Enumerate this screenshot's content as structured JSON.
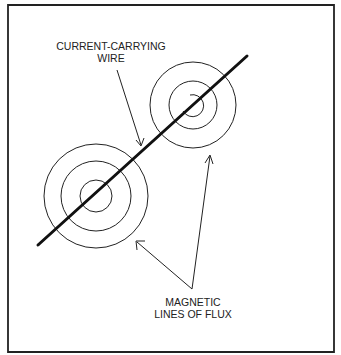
{
  "diagram": {
    "labels": {
      "wire_line1": "CURRENT-CARRYING",
      "wire_line2": "WIRE",
      "flux_line1": "MAGNETIC",
      "flux_line2": "LINES OF FLUX"
    },
    "colors": {
      "ink": "#1a1a1a",
      "background": "#ffffff"
    }
  }
}
